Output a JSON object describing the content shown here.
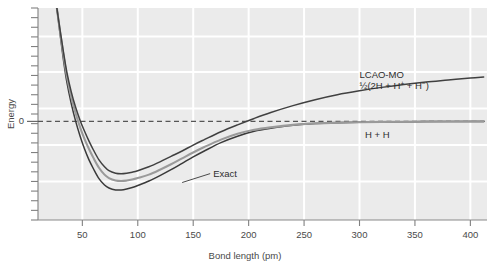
{
  "chart_data": {
    "type": "line",
    "title": "",
    "subtitle": "",
    "xlabel": "Bond length (pm)",
    "ylabel": "Energy",
    "xlim": [
      10,
      415
    ],
    "ylim": [
      -1.0,
      1.15
    ],
    "xticks": [
      50,
      100,
      150,
      200,
      250,
      300,
      350,
      400
    ],
    "xtick_labels": [
      "50",
      "100",
      "150",
      "200",
      "250",
      "300",
      "350",
      "400"
    ],
    "yticks": [
      0
    ],
    "ytick_labels": [
      "0"
    ],
    "grid": "white gridlines on light gray panel, vertical at every x tick, horizontal at evenly spaced unlabeled intervals",
    "legend_position": "inline annotations next to curves",
    "zero_reference_line": {
      "value": 0,
      "style": "dashed",
      "label": "0"
    },
    "annotations": [
      {
        "name": "lcao-mo-label",
        "text": "LCAO-MO",
        "x": 300,
        "y": 0.44
      },
      {
        "name": "lcao-mo-dissociation-products",
        "text_parts": [
          "½(2H + H",
          "+",
          " + H",
          "−",
          ")"
        ],
        "text": "½(2H + H+ + H−)",
        "x": 300,
        "y": 0.33
      },
      {
        "name": "h-plus-h-label",
        "text": "H + H",
        "x": 305,
        "y": -0.17
      },
      {
        "name": "exact-label",
        "text": "Exact",
        "x": 168,
        "y": -0.56,
        "leader_line_to": {
          "x": 140,
          "y": -0.62
        }
      }
    ],
    "series": [
      {
        "name": "LCAO-MO",
        "color": "#404040",
        "note": "upper dark curve; dissociates to 1/2(2H + H+ + H-), asymptote well above zero",
        "x": [
          27,
          30,
          33,
          36,
          40,
          44,
          48,
          52,
          56,
          60,
          65,
          70,
          74,
          80,
          85,
          90,
          95,
          100,
          110,
          120,
          130,
          140,
          150,
          160,
          175,
          190,
          205,
          220,
          240,
          260,
          280,
          300,
          320,
          340,
          360,
          380,
          400,
          412
        ],
        "y": [
          1.15,
          0.92,
          0.7,
          0.5,
          0.3,
          0.14,
          0.01,
          -0.1,
          -0.2,
          -0.29,
          -0.39,
          -0.46,
          -0.5,
          -0.525,
          -0.53,
          -0.525,
          -0.515,
          -0.5,
          -0.46,
          -0.41,
          -0.355,
          -0.3,
          -0.24,
          -0.185,
          -0.105,
          -0.035,
          0.03,
          0.09,
          0.16,
          0.22,
          0.27,
          0.31,
          0.345,
          0.375,
          0.4,
          0.42,
          0.44,
          0.45
        ]
      },
      {
        "name": "Exact",
        "color": "#9a9a9a",
        "note": "middle light gray curve, slightly deeper well than LCAO-MO",
        "x": [
          27,
          30,
          33,
          36,
          40,
          44,
          48,
          52,
          56,
          60,
          65,
          70,
          74,
          80,
          85,
          90,
          95,
          100,
          110,
          120,
          130,
          140,
          150,
          160,
          175,
          190,
          205,
          220,
          240,
          260,
          280,
          300,
          320,
          340,
          360,
          380,
          400,
          412
        ],
        "y": [
          1.15,
          0.9,
          0.67,
          0.46,
          0.25,
          0.08,
          -0.06,
          -0.18,
          -0.28,
          -0.37,
          -0.47,
          -0.54,
          -0.575,
          -0.6,
          -0.605,
          -0.6,
          -0.59,
          -0.575,
          -0.54,
          -0.49,
          -0.435,
          -0.375,
          -0.315,
          -0.26,
          -0.185,
          -0.125,
          -0.085,
          -0.06,
          -0.035,
          -0.02,
          -0.012,
          -0.008,
          -0.005,
          -0.003,
          -0.002,
          -0.001,
          0.0,
          0.0
        ]
      },
      {
        "name": "H + H",
        "color": "#3a3a3a",
        "note": "lower dark curve, deepest well; dissociates to H + H at zero",
        "x": [
          27,
          30,
          33,
          36,
          40,
          44,
          48,
          52,
          56,
          60,
          65,
          70,
          74,
          80,
          85,
          90,
          95,
          100,
          110,
          120,
          130,
          140,
          150,
          160,
          175,
          190,
          205,
          220,
          240,
          260,
          280,
          300,
          320,
          340,
          360,
          380,
          400,
          412
        ],
        "y": [
          1.15,
          0.88,
          0.62,
          0.4,
          0.18,
          0.0,
          -0.15,
          -0.28,
          -0.39,
          -0.48,
          -0.58,
          -0.645,
          -0.675,
          -0.695,
          -0.695,
          -0.685,
          -0.67,
          -0.65,
          -0.605,
          -0.55,
          -0.49,
          -0.425,
          -0.36,
          -0.3,
          -0.215,
          -0.15,
          -0.1,
          -0.07,
          -0.04,
          -0.022,
          -0.013,
          -0.008,
          -0.005,
          -0.003,
          -0.002,
          -0.001,
          0.0,
          0.0
        ]
      }
    ],
    "colors": {
      "panel_background": "#ebebeb",
      "gridline": "#ffffff",
      "axis": "#808080",
      "text": "#4a4a4a",
      "curve_dark": "#3a3a3a",
      "curve_gray": "#9a9a9a",
      "zero_line": "#555555"
    }
  }
}
